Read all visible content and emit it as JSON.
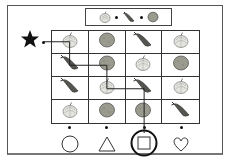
{
  "puzzle": {
    "pattern": [
      "onion",
      "carrot",
      "potato"
    ],
    "start_marker": "star",
    "grid": [
      [
        "onion",
        "potato",
        "carrot",
        "onion"
      ],
      [
        "carrot",
        "potato",
        "onion",
        "potato"
      ],
      [
        "carrot",
        "onion",
        "carrot",
        "onion"
      ],
      [
        "onion",
        "potato",
        "potato",
        "carrot"
      ]
    ],
    "path_cells": [
      [
        0,
        0
      ],
      [
        1,
        0
      ],
      [
        1,
        1
      ],
      [
        2,
        1
      ],
      [
        2,
        2
      ],
      [
        3,
        2
      ]
    ],
    "exits": [
      {
        "shape": "circle",
        "selected": false
      },
      {
        "shape": "triangle",
        "selected": false
      },
      {
        "shape": "square",
        "selected": true
      },
      {
        "shape": "heart",
        "selected": false
      }
    ],
    "answer": "square"
  },
  "colors": {
    "onion": "#e6e6e0",
    "onion_stroke": "#888888",
    "potato": "#9a9a8e",
    "carrot": "#555550",
    "line": "#222222"
  }
}
